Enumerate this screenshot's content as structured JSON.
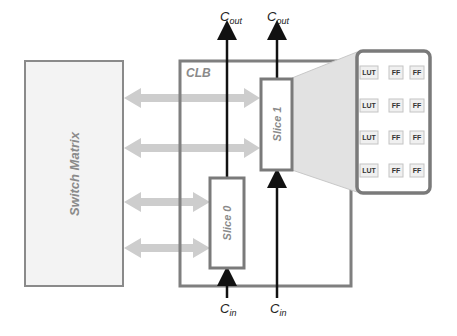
{
  "diagram": {
    "title": "",
    "switch_matrix": {
      "label": "Switch Matrix"
    },
    "clb": {
      "label": "CLB"
    },
    "slices": [
      {
        "id": "slice0",
        "label": "Slice 0"
      },
      {
        "id": "slice1",
        "label": "Slice 1"
      }
    ],
    "carry": {
      "out_label_main": "C",
      "out_label_sub": "out",
      "in_label_main": "C",
      "in_label_sub": "in"
    },
    "slice_detail": {
      "rows": [
        [
          "LUT",
          "FF",
          "FF"
        ],
        [
          "LUT",
          "FF",
          "FF"
        ],
        [
          "LUT",
          "FF",
          "FF"
        ],
        [
          "LUT",
          "FF",
          "FF"
        ]
      ]
    },
    "colors": {
      "box_border": "#7f7f7f",
      "switch_fill": "#f2f2f2",
      "arrow_fill": "#cfcfcf",
      "carry_line": "#111111",
      "zoom_fill": "#e4e4e4"
    }
  }
}
